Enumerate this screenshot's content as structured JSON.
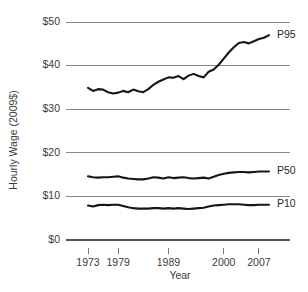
{
  "chart_data": {
    "type": "line",
    "title": "",
    "xlabel": "Year",
    "ylabel": "Hourly Wage (2009$)",
    "xlim": [
      1973,
      2009
    ],
    "ylim": [
      0,
      50
    ],
    "grid": true,
    "grid_axis": "y",
    "legend_position": "right-inline",
    "ytick_labels": [
      "$0",
      "$10",
      "$20",
      "$30",
      "$40",
      "$50"
    ],
    "ytick_values": [
      0,
      10,
      20,
      30,
      40,
      50
    ],
    "xtick_labels": [
      "1973",
      "1979",
      "1989",
      "2000",
      "2007"
    ],
    "xtick_values": [
      1973,
      1979,
      1989,
      2000,
      2007
    ],
    "x": [
      1973,
      1974,
      1975,
      1976,
      1977,
      1978,
      1979,
      1980,
      1981,
      1982,
      1983,
      1984,
      1985,
      1986,
      1987,
      1988,
      1989,
      1990,
      1991,
      1992,
      1993,
      1994,
      1995,
      1996,
      1997,
      1998,
      1999,
      2000,
      2001,
      2002,
      2003,
      2004,
      2005,
      2006,
      2007,
      2008,
      2009
    ],
    "series": [
      {
        "name": "P95",
        "label": "P95",
        "color": "#161616",
        "values": [
          34.9,
          34.2,
          34.6,
          34.5,
          33.9,
          33.6,
          33.8,
          34.2,
          33.9,
          34.5,
          34.1,
          33.9,
          34.6,
          35.6,
          36.3,
          36.8,
          37.3,
          37.2,
          37.6,
          36.9,
          37.7,
          38.1,
          37.6,
          37.3,
          38.6,
          39.1,
          40.2,
          41.6,
          43.0,
          44.2,
          45.2,
          45.4,
          45.1,
          45.6,
          46.1,
          46.4,
          47.0
        ]
      },
      {
        "name": "P50",
        "label": "P50",
        "color": "#161616",
        "values": [
          14.6,
          14.4,
          14.3,
          14.4,
          14.4,
          14.5,
          14.6,
          14.3,
          14.1,
          14.0,
          13.9,
          13.9,
          14.1,
          14.4,
          14.3,
          14.1,
          14.4,
          14.2,
          14.3,
          14.4,
          14.2,
          14.1,
          14.2,
          14.3,
          14.1,
          14.5,
          14.9,
          15.2,
          15.4,
          15.5,
          15.6,
          15.6,
          15.5,
          15.6,
          15.7,
          15.7,
          15.7
        ]
      },
      {
        "name": "P10",
        "label": "P10",
        "color": "#161616",
        "values": [
          7.9,
          7.7,
          8.0,
          8.1,
          8.0,
          8.1,
          8.1,
          7.8,
          7.5,
          7.3,
          7.2,
          7.2,
          7.2,
          7.3,
          7.3,
          7.2,
          7.3,
          7.2,
          7.3,
          7.2,
          7.1,
          7.2,
          7.3,
          7.4,
          7.7,
          7.9,
          8.0,
          8.1,
          8.2,
          8.2,
          8.2,
          8.1,
          8.0,
          8.0,
          8.1,
          8.1,
          8.1
        ]
      }
    ]
  }
}
